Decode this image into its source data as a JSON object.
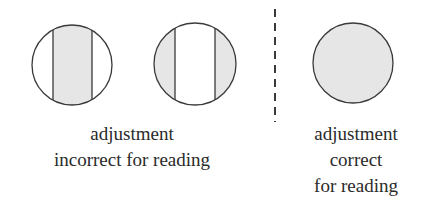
{
  "figure": {
    "colors": {
      "stroke": "#3a3a3a",
      "fill_shaded": "#e6e6e6",
      "background": "#ffffff"
    },
    "left_group": {
      "label_lines": [
        "adjustment",
        "incorrect for reading"
      ],
      "circles": [
        {
          "id": "incorrect-1",
          "shading": "center band shaded"
        },
        {
          "id": "incorrect-2",
          "shading": "outer segments shaded"
        }
      ]
    },
    "divider": {
      "style": "dashed vertical line"
    },
    "right_group": {
      "label_lines": [
        "adjustment",
        "correct",
        "for reading"
      ],
      "circles": [
        {
          "id": "correct-1",
          "shading": "fully shaded uniform"
        }
      ]
    }
  }
}
